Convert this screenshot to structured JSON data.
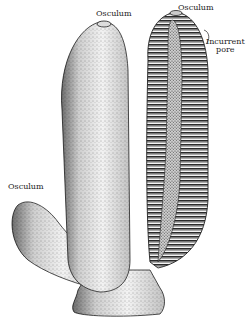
{
  "figure": {
    "colors": {
      "ink": "#1a1a1a",
      "paper": "#ffffff",
      "stipple_light": "#e8e8e8",
      "stipple_mid": "#b5b5b5",
      "canal_dark": "#3a3a3a"
    }
  },
  "labels": {
    "osculum_main": "Osculum",
    "osculum_section": "Osculum",
    "incurrent_pore_line1": "Incurrent",
    "incurrent_pore_line2": "pore",
    "osculum_bud": "Osculum"
  }
}
